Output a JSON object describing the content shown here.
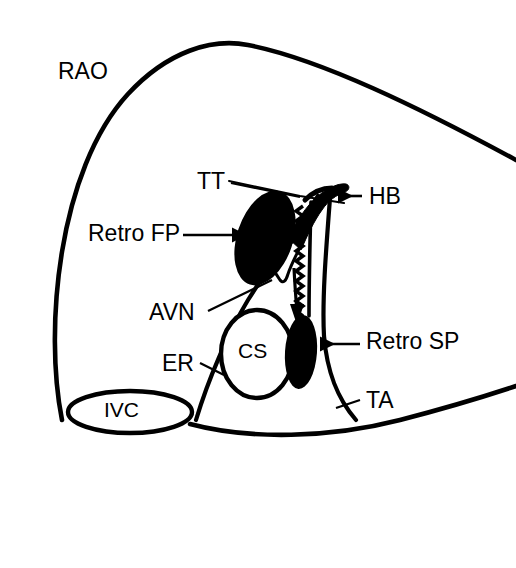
{
  "figure": {
    "kind": "anatomical-diagram",
    "background_color": "#ffffff",
    "ink_color": "#000000"
  },
  "labels": {
    "rao": "RAO",
    "tt": "TT",
    "hb": "HB",
    "retro_fp": "Retro FP",
    "avn": "AVN",
    "er": "ER",
    "cs": "CS",
    "retro_sp": "Retro SP",
    "ta": "TA",
    "ivc": "IVC"
  },
  "label_positions": {
    "rao": {
      "x": 58,
      "y": 60
    },
    "tt": {
      "x": 197,
      "y": 170
    },
    "hb": {
      "x": 369,
      "y": 185
    },
    "retro_fp": {
      "x": 88,
      "y": 222
    },
    "avn": {
      "x": 149,
      "y": 301
    },
    "er": {
      "x": 162,
      "y": 352
    },
    "cs": {
      "x": 238,
      "y": 340
    },
    "retro_sp": {
      "x": 366,
      "y": 330
    },
    "ta": {
      "x": 366,
      "y": 389
    },
    "ivc": {
      "x": 104,
      "y": 399
    }
  },
  "structures": [
    {
      "name": "atrial-silhouette",
      "abbr": "RAO",
      "description": "Outer right atrial border in right anterior oblique view"
    },
    {
      "name": "tendon-of-todaro",
      "abbr": "TT",
      "description": "Tendon of Todaro, upper border of the triangle of Koch"
    },
    {
      "name": "his-bundle",
      "abbr": "HB",
      "description": "His bundle recording site at the apex of the triangle of Koch"
    },
    {
      "name": "retrograde-fast-pathway",
      "abbr": "Retro FP",
      "description": "Retrograde fast pathway ablation / activation region"
    },
    {
      "name": "av-node",
      "abbr": "AVN",
      "description": "Atrioventricular node"
    },
    {
      "name": "eustachian-ridge",
      "abbr": "ER",
      "description": "Eustachian ridge"
    },
    {
      "name": "coronary-sinus-ostium",
      "abbr": "CS",
      "description": "Coronary sinus ostium"
    },
    {
      "name": "retrograde-slow-pathway",
      "abbr": "Retro SP",
      "description": "Retrograde slow pathway region near the CS ostium"
    },
    {
      "name": "tricuspid-annulus",
      "abbr": "TA",
      "description": "Tricuspid annulus"
    },
    {
      "name": "inferior-vena-cava",
      "abbr": "IVC",
      "description": "Inferior vena cava ostium"
    }
  ],
  "annotations": {
    "conduction_arrow": {
      "name": "retrograde-conduction-arrow",
      "direction": "downward",
      "from": "his-bundle",
      "to": "retrograde-slow-pathway"
    },
    "serrated_band": {
      "name": "slow-pathway-serrated-band",
      "description": "Sawtooth band depicting the slow pathway course"
    }
  },
  "leaders": [
    {
      "name": "tt-leader",
      "from": "tt-label",
      "to": "tendon-of-todaro",
      "arrowhead": false
    },
    {
      "name": "hb-leader",
      "from": "hb-label",
      "to": "his-bundle",
      "arrowhead": true,
      "direction": "left"
    },
    {
      "name": "retro-fp-leader",
      "from": "retro-fp-label",
      "to": "retrograde-fast-pathway",
      "arrowhead": true,
      "direction": "right"
    },
    {
      "name": "avn-leader",
      "from": "avn-label",
      "to": "av-node",
      "arrowhead": false
    },
    {
      "name": "er-leader",
      "from": "er-label",
      "to": "eustachian-ridge",
      "arrowhead": false
    },
    {
      "name": "retro-sp-leader",
      "from": "retro-sp-label",
      "to": "retrograde-slow-pathway",
      "arrowhead": true,
      "direction": "left"
    },
    {
      "name": "ta-leader",
      "from": "ta-label",
      "to": "tricuspid-annulus",
      "arrowhead": false
    }
  ]
}
